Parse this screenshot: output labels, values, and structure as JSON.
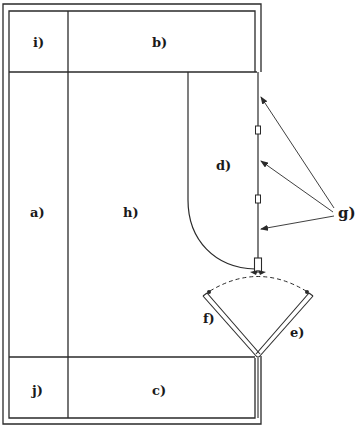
{
  "diagram": {
    "type": "floor-plan",
    "labels": {
      "a": "a)",
      "b": "b)",
      "c": "c)",
      "d": "d)",
      "e": "e)",
      "f": "f)",
      "g": "g)",
      "h": "h)",
      "i": "i)",
      "j": "j)"
    },
    "regions": [
      {
        "id": "i",
        "label": "i)",
        "position": "top-left cell"
      },
      {
        "id": "b",
        "label": "b)",
        "position": "top band"
      },
      {
        "id": "a",
        "label": "a)",
        "position": "left column"
      },
      {
        "id": "h",
        "label": "h)",
        "position": "central area"
      },
      {
        "id": "d",
        "label": "d)",
        "position": "curved right area"
      },
      {
        "id": "j",
        "label": "j)",
        "position": "bottom-left cell"
      },
      {
        "id": "c",
        "label": "c)",
        "position": "bottom band"
      },
      {
        "id": "e",
        "label": "e)",
        "position": "right door panel"
      },
      {
        "id": "f",
        "label": "f)",
        "position": "left door panel"
      },
      {
        "id": "g",
        "label": "g)",
        "position": "callout with three arrows to right wall"
      }
    ],
    "colors": {
      "line": "#2a2a2a",
      "background": "#ffffff"
    }
  }
}
